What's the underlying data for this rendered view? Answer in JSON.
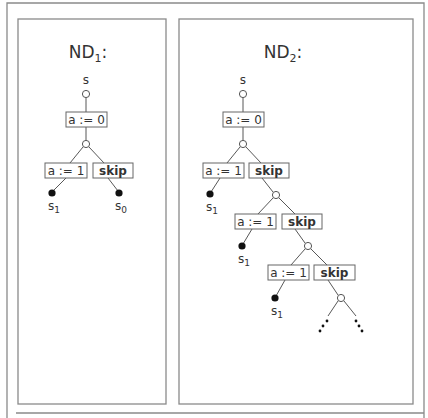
{
  "figure": {
    "panels": [
      {
        "id": "nd1",
        "title": "ND",
        "title_sub": "1",
        "title_suffix": ":",
        "frame": {
          "x": 18,
          "y": 19,
          "w": 148,
          "h": 385
        },
        "title_pos": {
          "x": 88,
          "y": 58
        },
        "root_label": {
          "text": "s",
          "x": 86,
          "y": 84
        },
        "open_nodes": [
          {
            "x": 86,
            "y": 94
          },
          {
            "x": 86,
            "y": 144
          }
        ],
        "boxes": [
          {
            "text": "a := 0",
            "bold": false,
            "x": 66,
            "y": 112,
            "w": 41,
            "h": 15
          },
          {
            "text": "a := 1",
            "bold": false,
            "x": 45,
            "y": 163,
            "w": 42,
            "h": 15
          },
          {
            "text": "skip",
            "bold": true,
            "x": 93,
            "y": 163,
            "w": 40,
            "h": 15
          }
        ],
        "edges": [
          [
            86,
            98,
            86,
            112
          ],
          [
            86,
            127,
            86,
            140
          ],
          [
            83,
            147,
            70,
            163
          ],
          [
            89,
            147,
            104,
            163
          ],
          [
            66,
            178,
            53,
            191
          ],
          [
            108,
            178,
            118,
            191
          ]
        ],
        "leaves": [
          {
            "x": 52,
            "y": 193,
            "label": "s",
            "sub": "1"
          },
          {
            "x": 119,
            "y": 193,
            "label": "s",
            "sub": "0"
          }
        ]
      },
      {
        "id": "nd2",
        "title": "ND",
        "title_sub": "2",
        "title_suffix": ":",
        "frame": {
          "x": 179,
          "y": 19,
          "w": 234,
          "h": 385
        },
        "title_pos": {
          "x": 283,
          "y": 58
        },
        "root_label": {
          "text": "s",
          "x": 243,
          "y": 84
        },
        "open_nodes": [
          {
            "x": 243,
            "y": 94
          },
          {
            "x": 243,
            "y": 144
          },
          {
            "x": 276,
            "y": 195
          },
          {
            "x": 308,
            "y": 246
          },
          {
            "x": 341,
            "y": 298
          }
        ],
        "boxes": [
          {
            "text": "a := 0",
            "bold": false,
            "x": 223,
            "y": 112,
            "w": 41,
            "h": 15
          },
          {
            "text": "a := 1",
            "bold": false,
            "x": 203,
            "y": 163,
            "w": 41,
            "h": 15
          },
          {
            "text": "skip",
            "bold": true,
            "x": 249,
            "y": 163,
            "w": 40,
            "h": 15
          },
          {
            "text": "a := 1",
            "bold": false,
            "x": 235,
            "y": 214,
            "w": 41,
            "h": 15
          },
          {
            "text": "skip",
            "bold": true,
            "x": 282,
            "y": 214,
            "w": 40,
            "h": 15
          },
          {
            "text": "a := 1",
            "bold": false,
            "x": 268,
            "y": 265,
            "w": 41,
            "h": 15
          },
          {
            "text": "skip",
            "bold": true,
            "x": 314,
            "y": 265,
            "w": 41,
            "h": 15
          }
        ],
        "edges": [
          [
            243,
            98,
            243,
            112
          ],
          [
            243,
            127,
            243,
            140
          ],
          [
            240,
            147,
            227,
            163
          ],
          [
            246,
            147,
            261,
            163
          ],
          [
            220,
            178,
            211,
            192
          ],
          [
            262,
            178,
            273,
            192
          ],
          [
            273,
            198,
            258,
            214
          ],
          [
            279,
            198,
            295,
            214
          ],
          [
            252,
            229,
            243,
            244
          ],
          [
            295,
            229,
            305,
            243
          ],
          [
            305,
            249,
            291,
            265
          ],
          [
            311,
            249,
            327,
            265
          ],
          [
            285,
            280,
            276,
            296
          ],
          [
            328,
            280,
            338,
            295
          ],
          [
            338,
            301,
            328,
            316
          ],
          [
            344,
            301,
            356,
            316
          ]
        ],
        "leaves": [
          {
            "x": 210,
            "y": 194,
            "label": "s",
            "sub": "1"
          },
          {
            "x": 242,
            "y": 246,
            "label": "s",
            "sub": "1"
          },
          {
            "x": 275,
            "y": 298,
            "label": "s",
            "sub": "1"
          }
        ],
        "ellipsis_dots": [
          {
            "x": 327,
            "y": 321
          },
          {
            "x": 323,
            "y": 326
          },
          {
            "x": 320,
            "y": 331
          },
          {
            "x": 356,
            "y": 321
          },
          {
            "x": 359,
            "y": 326
          },
          {
            "x": 362,
            "y": 331
          }
        ]
      }
    ],
    "outer_frame": {
      "x": 7,
      "y": 3,
      "w": 417,
      "h": 430
    },
    "bottom_rule": {
      "x1": 16,
      "y1": 413,
      "x2": 424,
      "y2": 413
    }
  }
}
